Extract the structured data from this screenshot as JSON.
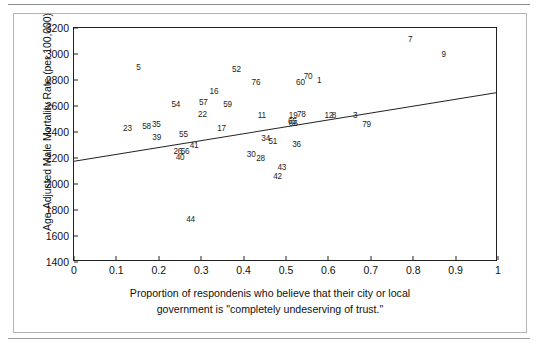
{
  "chart_data": {
    "type": "scatter",
    "title": "",
    "xlabel": "Proportion of respondenis who believe that their city or local government is \"completely undeserving of trust.\"",
    "xlabel_line1": "Proportion of respondenis who believe that their city or local",
    "xlabel_line2": "government is \"completely undeserving of trust.\"",
    "ylabel": "Age-Adjusted Male Mortality Rate (per 100,000)",
    "xlim": [
      0,
      1
    ],
    "ylim": [
      1400,
      3200
    ],
    "xticks": [
      "0",
      "0.1",
      "0.2",
      "0.3",
      "0.4",
      "0.5",
      "0.6",
      "0.7",
      "0.8",
      "0.9",
      "1"
    ],
    "xtick_values": [
      0,
      0.1,
      0.2,
      0.3,
      0.4,
      0.5,
      0.6,
      0.7,
      0.8,
      0.9,
      1
    ],
    "yticks": [
      "1400",
      "1600",
      "1800",
      "2000",
      "2200",
      "2400",
      "2600",
      "2800",
      "3000",
      "3200"
    ],
    "ytick_values": [
      1400,
      1600,
      1800,
      2000,
      2200,
      2400,
      2600,
      2800,
      3000,
      3200
    ],
    "grid": false,
    "legend": false,
    "marker_style": "numeric-label",
    "trendline": {
      "name": "linear fit",
      "x": [
        0,
        1
      ],
      "y": [
        2170,
        2700
      ],
      "color": "#222222"
    },
    "points": [
      {
        "label": "5",
        "x": 0.152,
        "y": 2895
      },
      {
        "label": "52",
        "x": 0.383,
        "y": 2880
      },
      {
        "label": "7",
        "x": 0.793,
        "y": 3110
      },
      {
        "label": "9",
        "x": 0.872,
        "y": 2995
      },
      {
        "label": "70",
        "x": 0.552,
        "y": 2820
      },
      {
        "label": "1",
        "x": 0.578,
        "y": 2790
      },
      {
        "label": "60",
        "x": 0.534,
        "y": 2775
      },
      {
        "label": "76",
        "x": 0.429,
        "y": 2775
      },
      {
        "label": "16",
        "x": 0.33,
        "y": 2705
      },
      {
        "label": "57",
        "x": 0.305,
        "y": 2625
      },
      {
        "label": "54",
        "x": 0.24,
        "y": 2610
      },
      {
        "label": "59",
        "x": 0.362,
        "y": 2605
      },
      {
        "label": "22",
        "x": 0.303,
        "y": 2530
      },
      {
        "label": "11",
        "x": 0.443,
        "y": 2525
      },
      {
        "label": "19",
        "x": 0.517,
        "y": 2525
      },
      {
        "label": "78",
        "x": 0.536,
        "y": 2530
      },
      {
        "label": "12",
        "x": 0.601,
        "y": 2525
      },
      {
        "label": "8",
        "x": 0.613,
        "y": 2525
      },
      {
        "label": "3",
        "x": 0.663,
        "y": 2525
      },
      {
        "label": "65",
        "x": 0.515,
        "y": 2480
      },
      {
        "label": "66",
        "x": 0.517,
        "y": 2462
      },
      {
        "label": "35",
        "x": 0.194,
        "y": 2455
      },
      {
        "label": "79",
        "x": 0.69,
        "y": 2455
      },
      {
        "label": "58",
        "x": 0.171,
        "y": 2440
      },
      {
        "label": "23",
        "x": 0.126,
        "y": 2425
      },
      {
        "label": "17",
        "x": 0.348,
        "y": 2425
      },
      {
        "label": "55",
        "x": 0.258,
        "y": 2380
      },
      {
        "label": "39",
        "x": 0.195,
        "y": 2355
      },
      {
        "label": "34",
        "x": 0.452,
        "y": 2345
      },
      {
        "label": "51",
        "x": 0.469,
        "y": 2325
      },
      {
        "label": "36",
        "x": 0.525,
        "y": 2300
      },
      {
        "label": "41",
        "x": 0.283,
        "y": 2290
      },
      {
        "label": "26",
        "x": 0.245,
        "y": 2245
      },
      {
        "label": "56",
        "x": 0.262,
        "y": 2250
      },
      {
        "label": "30",
        "x": 0.418,
        "y": 2220
      },
      {
        "label": "28",
        "x": 0.44,
        "y": 2190
      },
      {
        "label": "40",
        "x": 0.25,
        "y": 2200
      },
      {
        "label": "43",
        "x": 0.49,
        "y": 2125
      },
      {
        "label": "42",
        "x": 0.48,
        "y": 2055
      },
      {
        "label": "44",
        "x": 0.275,
        "y": 1725
      }
    ]
  }
}
